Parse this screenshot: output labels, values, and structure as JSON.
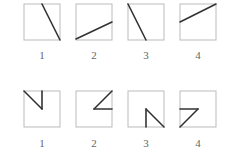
{
  "figure": {
    "box_stroke": "#bbbbbb",
    "line_stroke": "#333333",
    "rows": [
      {
        "name": "row-1",
        "items": [
          {
            "label": "1",
            "x": 24,
            "y": 4,
            "lines": [
              [
                18,
                0,
                36,
                36
              ]
            ]
          },
          {
            "label": "2",
            "x": 76,
            "y": 4,
            "lines": [
              [
                0,
                35,
                36,
                18
              ]
            ]
          },
          {
            "label": "3",
            "x": 128,
            "y": 4,
            "lines": [
              [
                0,
                0,
                18,
                36
              ]
            ]
          },
          {
            "label": "4",
            "x": 180,
            "y": 4,
            "lines": [
              [
                0,
                18,
                36,
                0
              ]
            ]
          }
        ],
        "label_y": 55
      },
      {
        "name": "row-2",
        "items": [
          {
            "label": "1",
            "x": 24,
            "y": 91,
            "lines": [
              [
                0,
                0,
                18,
                18
              ],
              [
                18,
                0,
                18,
                18
              ]
            ]
          },
          {
            "label": "2",
            "x": 76,
            "y": 91,
            "lines": [
              [
                36,
                0,
                18,
                18
              ],
              [
                18,
                18,
                36,
                18
              ]
            ]
          },
          {
            "label": "3",
            "x": 128,
            "y": 91,
            "lines": [
              [
                18,
                18,
                36,
                36
              ],
              [
                18,
                18,
                18,
                36
              ]
            ]
          },
          {
            "label": "4",
            "x": 180,
            "y": 91,
            "lines": [
              [
                0,
                18,
                18,
                18
              ],
              [
                18,
                18,
                0,
                36
              ]
            ]
          }
        ],
        "label_y": 143
      }
    ]
  }
}
